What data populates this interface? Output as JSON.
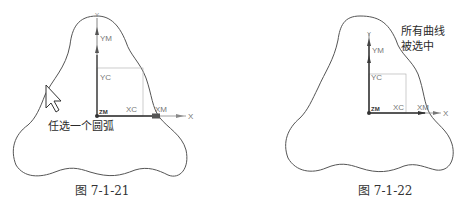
{
  "figures": [
    {
      "id": "7-1-21",
      "caption": "图 7-1-21",
      "annotation": "任选一个圆弧",
      "state": "cursor selecting one arc",
      "axis_labels": {
        "x": "X",
        "y": "Y",
        "xm": "XM",
        "ym": "YM",
        "xc": "XC",
        "yc": "YC",
        "zm": "ZM"
      },
      "icons": [
        "arrow-cursor-icon"
      ]
    },
    {
      "id": "7-1-22",
      "caption": "图 7-1-22",
      "annotation_lines": [
        "所有曲线",
        "被选中"
      ],
      "state": "all curves selected",
      "axis_labels": {
        "x": "X",
        "y": "Y",
        "xm": "XM",
        "ym": "YM",
        "xc": "XC",
        "yc": "YC",
        "zm": "ZM"
      }
    }
  ],
  "colors": {
    "outline": "#555555",
    "axis": "#444444",
    "grid_rect": "#aaaaaa",
    "label": "#777777"
  }
}
